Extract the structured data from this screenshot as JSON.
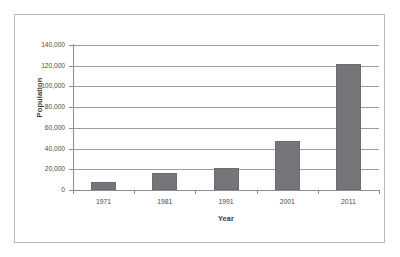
{
  "chart_data": {
    "type": "bar",
    "title": "",
    "xlabel": "Year",
    "ylabel": "Population",
    "categories": [
      "1971",
      "1981",
      "1991",
      "2001",
      "2011"
    ],
    "values": [
      8000,
      16000,
      21000,
      47000,
      122000
    ],
    "series": [
      {
        "name": "Population",
        "values": [
          8000,
          16000,
          21000,
          47000,
          122000
        ]
      }
    ],
    "ylim": [
      0,
      140000
    ],
    "ytick_step": 20000,
    "ytick_labels": [
      "140,000",
      "120,000",
      "100,000",
      "80,000",
      "60,000",
      "40,000",
      "20,000",
      "0"
    ],
    "ytick_values": [
      140000,
      120000,
      100000,
      80000,
      60000,
      40000,
      20000,
      0
    ],
    "xtick_labels": [
      "1971",
      "1981",
      "1991",
      "2001",
      "2011"
    ],
    "grid": "horizontal",
    "legend": "none",
    "bar_color": "#76767a",
    "gridline_color": "#9d9d9d",
    "axis_color": "#8e8e8e",
    "text_color": "#4a4a4a",
    "background": "#ffffff",
    "border_color": "#b9b9b9"
  }
}
